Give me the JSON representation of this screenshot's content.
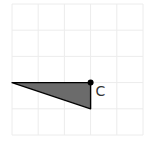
{
  "diagram": {
    "type": "grid-geometry",
    "grid": {
      "columns": 5,
      "rows": 5,
      "line_color": "#ececec"
    },
    "triangle": {
      "vertices_grid_units": [
        [
          0,
          3
        ],
        [
          3,
          3
        ],
        [
          3,
          4
        ]
      ],
      "fill_color": "#6b6b6b",
      "stroke_color": "#000000"
    },
    "point": {
      "label": "C",
      "grid_units": [
        3,
        3
      ],
      "color": "#000000"
    }
  }
}
